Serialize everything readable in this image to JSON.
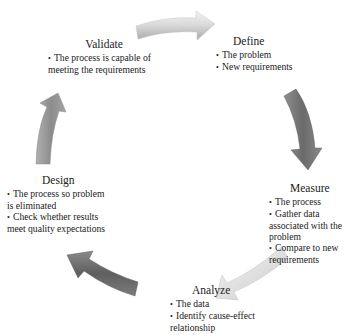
{
  "diagram": {
    "type": "cycle",
    "stages": [
      {
        "id": "define",
        "title": "Define",
        "bullets": [
          "The problem",
          "New requirements"
        ]
      },
      {
        "id": "measure",
        "title": "Measure",
        "bullets": [
          "The process",
          "Gather data associated with the problem",
          "Compare to new requirements"
        ]
      },
      {
        "id": "analyze",
        "title": "Analyze",
        "bullets": [
          "The data",
          "Identify cause-effect relationship"
        ]
      },
      {
        "id": "design",
        "title": "Design",
        "bullets": [
          "The process so problem is eliminated",
          "Check whether results meet quality expectations"
        ]
      },
      {
        "id": "validate",
        "title": "Validate",
        "bullets": [
          "The process is capable of meeting the requirements"
        ]
      }
    ],
    "arrows": [
      {
        "from": "validate",
        "to": "define",
        "shade": "light",
        "color": "#d9d9d9"
      },
      {
        "from": "define",
        "to": "measure",
        "shade": "dark",
        "color": "#7a7a7a"
      },
      {
        "from": "measure",
        "to": "analyze",
        "shade": "light",
        "color": "#dcdcdc"
      },
      {
        "from": "analyze",
        "to": "design",
        "shade": "dark",
        "color": "#6e6e6e"
      },
      {
        "from": "design",
        "to": "validate",
        "shade": "medium",
        "color": "#9a9a9a"
      }
    ]
  }
}
